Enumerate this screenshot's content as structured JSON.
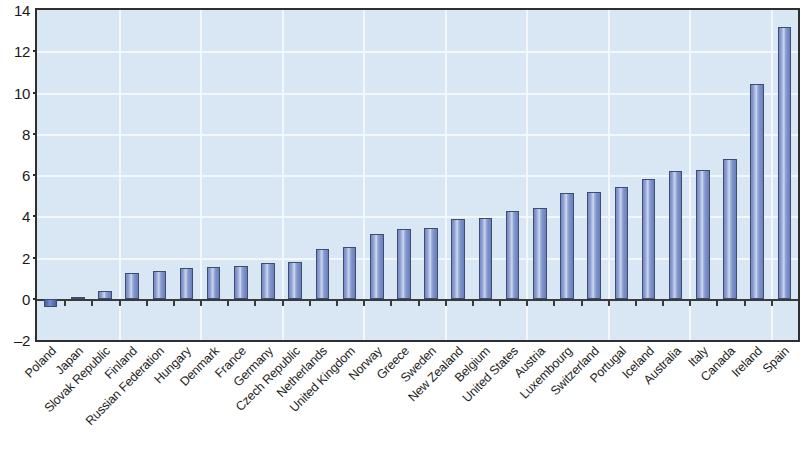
{
  "chart_data": {
    "type": "bar",
    "title": "",
    "subtitle": "",
    "xlabel": "",
    "ylabel": "",
    "ylim": [
      -2,
      14
    ],
    "yticks": [
      -2,
      0,
      2,
      4,
      6,
      8,
      10,
      12,
      14
    ],
    "ytick_labels": [
      "-2",
      "0",
      "2",
      "4",
      "6",
      "8",
      "10",
      "12",
      "14"
    ],
    "grid": true,
    "legend": "none",
    "orientation": "vertical",
    "categories": [
      "Poland",
      "Japan",
      "Slovak Republic",
      "Finland",
      "Russian Federation",
      "Hungary",
      "Denmark",
      "France",
      "Germany",
      "Czech Republic",
      "Netherlands",
      "United Kingdom",
      "Norway",
      "Greece",
      "Sweden",
      "New Zealand",
      "Belgium",
      "United States",
      "Austria",
      "Luxembourg",
      "Switzerland",
      "Portugal",
      "Iceland",
      "Australia",
      "Italy",
      "Canada",
      "Ireland",
      "Spain"
    ],
    "values": [
      -0.4,
      0.1,
      0.4,
      1.25,
      1.35,
      1.5,
      1.55,
      1.6,
      1.75,
      1.8,
      2.4,
      2.5,
      3.15,
      3.4,
      3.45,
      3.85,
      3.9,
      4.25,
      4.4,
      5.15,
      5.2,
      5.4,
      5.8,
      6.2,
      6.25,
      6.8,
      10.4,
      13.2
    ],
    "colors": {
      "bar_face_light": "#cdd8ee",
      "bar_face_mid": "#8a9bd1",
      "bar_face_dark": "#6a80bd",
      "bar_outline": "#3d4d6e",
      "negative_bar": "#4a63ae",
      "plot_background": "#d9e6f4",
      "gridline": "#f2f7fc",
      "axis": "#2f2f2f",
      "text": "#1e1e1e"
    }
  }
}
